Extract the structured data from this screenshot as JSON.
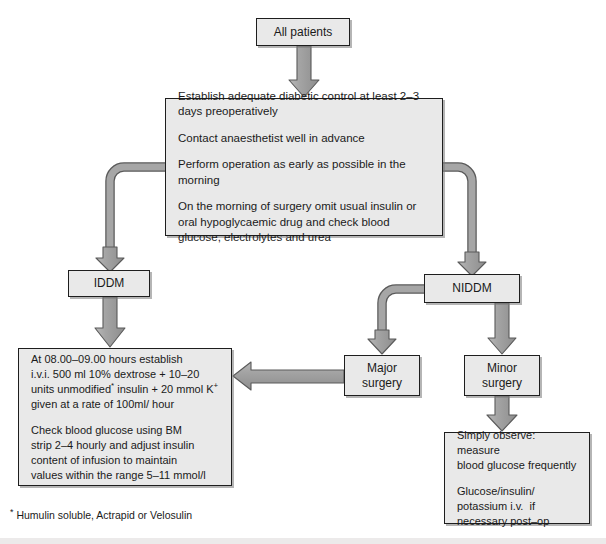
{
  "diagram": {
    "colors": {
      "box_fill": "#e9e9e9",
      "box_border": "#1e1e1e",
      "arrow_fill": "#9a9a9a",
      "arrow_stroke": "#4a4a4a",
      "background": "#ffffff"
    },
    "nodes": {
      "all_patients": {
        "label": "All patients"
      },
      "preop": {
        "lines": [
          "Establish adequate diabetic control at least 2–3 days preoperatively",
          "Contact anaesthetist well in advance",
          "Perform operation as early as possible in the morning",
          "On the morning of surgery omit usual insulin or oral hypoglycaemic drug and check blood glucose, electrolytes and urea"
        ]
      },
      "iddm": {
        "label": "IDDM"
      },
      "niddm": {
        "label": "NIDDM"
      },
      "major_surgery": {
        "line1": "Major",
        "line2": "surgery"
      },
      "minor_surgery": {
        "line1": "Minor",
        "line2": "surgery"
      },
      "insulin_regimen": {
        "para1_pre": "At 08.00–09.00 hours establish\ni.v.i. 500 ml 10% dextrose + 10–20\nunits unmodified",
        "para1_sup": "*",
        "para1_post": " insulin + 20 mmol K",
        "para1_sup2": "+",
        "para1_tail": "\ngiven at a rate of 100ml/ hour",
        "para2": "Check blood glucose using BM\nstrip 2–4 hourly and adjust insulin\ncontent of infusion to maintain\nvalues within the range 5–11 mmol/l"
      },
      "observe": {
        "para1": "Simply observe: measure\nblood glucose frequently",
        "para2": "Glucose/insulin/\npotassium i.v.  if\nnecessary post–op"
      }
    },
    "footnote": {
      "marker": "*",
      "text": " Humulin soluble, Actrapid or Velosulin"
    }
  }
}
